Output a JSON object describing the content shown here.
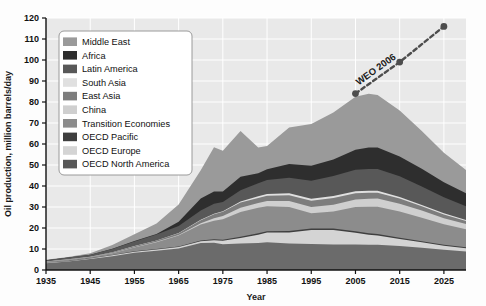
{
  "chart_data": {
    "type": "area",
    "stacked": true,
    "title": "",
    "xlabel": "Year",
    "ylabel": "Oil production, million barrels/day",
    "xlim": [
      1935,
      2030
    ],
    "ylim": [
      0,
      120
    ],
    "ytick_step": 10,
    "xtick_step": 10,
    "xticks": [
      1935,
      1945,
      1955,
      1965,
      1975,
      1985,
      1995,
      2005,
      2015,
      2025
    ],
    "yticks": [
      0,
      10,
      20,
      30,
      40,
      50,
      60,
      70,
      80,
      90,
      100,
      110,
      120
    ],
    "grid": true,
    "grid_color": "#ffffff",
    "plot_bg": "#e9e9e9",
    "legend_position": "upper-left",
    "x": [
      1935,
      1940,
      1945,
      1950,
      1955,
      1960,
      1965,
      1970,
      1973,
      1975,
      1979,
      1983,
      1985,
      1990,
      1995,
      2000,
      2005,
      2008,
      2010,
      2015,
      2020,
      2025,
      2030
    ],
    "series": [
      {
        "name": "OECD North America",
        "color": "#6b6b6b",
        "values": [
          3.2,
          4.0,
          5.2,
          6.6,
          8.2,
          9.2,
          10.2,
          12.8,
          13.0,
          12.3,
          12.6,
          12.8,
          13.2,
          12.6,
          12.4,
          12.2,
          12.1,
          12.0,
          12.0,
          11.4,
          10.6,
          9.6,
          8.8
        ]
      },
      {
        "name": "OECD Europe",
        "color": "#d4d4d4",
        "values": [
          0.2,
          0.2,
          0.3,
          0.4,
          0.5,
          0.6,
          0.7,
          0.9,
          1.2,
          1.6,
          2.6,
          4.0,
          4.6,
          5.2,
          6.6,
          6.8,
          5.6,
          4.8,
          4.4,
          3.4,
          2.6,
          2.0,
          1.6
        ]
      },
      {
        "name": "OECD Pacific",
        "color": "#3f3f3f",
        "values": [
          0.1,
          0.1,
          0.1,
          0.1,
          0.2,
          0.2,
          0.3,
          0.4,
          0.5,
          0.5,
          0.6,
          0.7,
          0.7,
          0.8,
          0.8,
          0.8,
          0.7,
          0.7,
          0.7,
          0.6,
          0.5,
          0.4,
          0.4
        ]
      },
      {
        "name": "Transition Economies",
        "color": "#8c8c8c",
        "values": [
          0.5,
          0.6,
          0.6,
          0.9,
          1.8,
          3.2,
          5.2,
          7.6,
          8.8,
          9.8,
          11.8,
          12.2,
          11.8,
          11.4,
          7.2,
          8.0,
          11.6,
          12.6,
          13.0,
          12.4,
          11.2,
          9.8,
          8.6
        ]
      },
      {
        "name": "China",
        "color": "#cfcfcf",
        "values": [
          0.0,
          0.0,
          0.0,
          0.1,
          0.1,
          0.2,
          0.3,
          0.6,
          1.1,
          1.5,
          2.1,
          2.2,
          2.5,
          2.8,
          3.0,
          3.3,
          3.6,
          3.8,
          3.9,
          3.8,
          3.4,
          2.9,
          2.5
        ]
      },
      {
        "name": "East Asia",
        "color": "#7d7d7d",
        "values": [
          0.1,
          0.2,
          0.1,
          0.3,
          0.5,
          0.6,
          0.8,
          1.4,
          1.9,
          2.0,
          2.4,
          2.4,
          2.5,
          2.8,
          3.0,
          3.2,
          3.0,
          2.9,
          2.8,
          2.4,
          2.0,
          1.7,
          1.4
        ]
      },
      {
        "name": "South Asia",
        "color": "#e0e0e0",
        "values": [
          0.0,
          0.0,
          0.0,
          0.0,
          0.1,
          0.1,
          0.1,
          0.2,
          0.3,
          0.3,
          0.5,
          0.8,
          0.9,
          0.9,
          0.9,
          0.9,
          0.9,
          0.9,
          0.9,
          0.8,
          0.7,
          0.6,
          0.5
        ]
      },
      {
        "name": "Latin America",
        "color": "#585858",
        "values": [
          0.6,
          0.8,
          1.0,
          1.6,
          2.2,
          2.8,
          3.4,
          4.4,
          4.8,
          4.4,
          5.4,
          6.2,
          6.6,
          7.4,
          8.6,
          9.6,
          10.2,
          10.4,
          10.4,
          9.8,
          8.8,
          7.6,
          6.6
        ]
      },
      {
        "name": "Africa",
        "color": "#2e2e2e",
        "values": [
          0.0,
          0.0,
          0.0,
          0.1,
          0.2,
          0.3,
          2.0,
          5.8,
          5.8,
          5.0,
          6.4,
          4.8,
          5.2,
          6.6,
          7.2,
          7.8,
          9.6,
          10.2,
          10.2,
          9.4,
          8.4,
          7.2,
          6.2
        ]
      },
      {
        "name": "Middle East",
        "color": "#9a9a9a",
        "values": [
          0.2,
          0.3,
          0.7,
          1.8,
          3.2,
          5.0,
          8.2,
          13.4,
          21.0,
          19.4,
          21.8,
          12.2,
          11.0,
          17.4,
          19.8,
          22.4,
          25.2,
          25.6,
          25.0,
          22.0,
          18.0,
          14.0,
          11.0
        ]
      }
    ],
    "annotations": [
      {
        "label": "WEO 2006",
        "style": "dashed-line-with-markers",
        "color": "#4d4d4d",
        "points": [
          {
            "x": 2005,
            "y": 84
          },
          {
            "x": 2015,
            "y": 99
          },
          {
            "x": 2025,
            "y": 116
          }
        ]
      }
    ]
  },
  "legend": {
    "items": [
      {
        "label": "Middle East",
        "color": "#9a9a9a"
      },
      {
        "label": "Africa",
        "color": "#2e2e2e"
      },
      {
        "label": "Latin America",
        "color": "#585858"
      },
      {
        "label": "South Asia",
        "color": "#e0e0e0"
      },
      {
        "label": "East Asia",
        "color": "#7d7d7d"
      },
      {
        "label": "China",
        "color": "#cfcfcf"
      },
      {
        "label": "Transition Economies",
        "color": "#8c8c8c"
      },
      {
        "label": "OECD Pacific",
        "color": "#3f3f3f"
      },
      {
        "label": "OECD Europe",
        "color": "#d4d4d4"
      },
      {
        "label": "OECD North America",
        "color": "#585858"
      }
    ]
  },
  "axes": {
    "x_title": "Year",
    "y_title": "Oil production, million barrels/day"
  }
}
